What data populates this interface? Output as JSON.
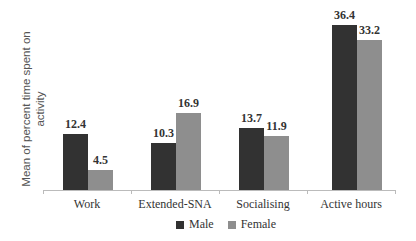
{
  "chart_data": {
    "type": "bar",
    "title": "",
    "xlabel": "",
    "ylabel": "Mean of percent time spent on activity",
    "categories": [
      "Work",
      "Extended-SNA",
      "Socialising",
      "Active hours"
    ],
    "series": [
      {
        "name": "Male",
        "color": "#323232",
        "values": [
          12.4,
          10.3,
          13.7,
          36.4
        ]
      },
      {
        "name": "Female",
        "color": "#8e8e8e",
        "values": [
          4.5,
          16.9,
          11.9,
          33.2
        ]
      }
    ],
    "value_labels": {
      "male": [
        "12.4",
        "10.3",
        "13.7",
        "36.4"
      ],
      "female": [
        "4.5",
        "16.9",
        "11.9",
        "33.2"
      ]
    },
    "ylim": [
      0,
      40
    ],
    "grid": false,
    "legend_position": "bottom"
  }
}
